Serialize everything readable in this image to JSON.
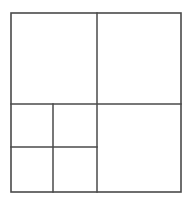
{
  "figure": {
    "type": "rectangle-dissection",
    "background_color": "#ffffff",
    "line_color": "#4a4a4a",
    "cell_fill_color": "#ffffff",
    "canvas": {
      "width": 193,
      "height": 202
    },
    "outer_square": {
      "name": "outer-square",
      "x": 11,
      "y": 13,
      "width": 170,
      "height": 179,
      "stroke_width": 1.6
    },
    "dividers": [
      {
        "name": "vertical-main-divider",
        "orientation": "vertical",
        "x": 97,
        "y1": 13,
        "y2": 192,
        "stroke_width": 1.5
      },
      {
        "name": "horizontal-main-divider",
        "orientation": "horizontal",
        "y": 104,
        "x1": 11,
        "x2": 181,
        "stroke_width": 1.5
      },
      {
        "name": "vertical-sub-divider-lower-left",
        "orientation": "vertical",
        "x": 53,
        "y1": 104,
        "y2": 192,
        "stroke_width": 1.5
      },
      {
        "name": "horizontal-sub-divider-lower-left",
        "orientation": "horizontal",
        "y": 147,
        "x1": 11,
        "x2": 97,
        "stroke_width": 1.5
      }
    ],
    "cells": [
      {
        "name": "cell-top-left",
        "x": 11,
        "y": 13,
        "width": 86,
        "height": 91,
        "label": ""
      },
      {
        "name": "cell-top-right",
        "x": 97,
        "y": 13,
        "width": 84,
        "height": 91,
        "label": ""
      },
      {
        "name": "cell-mid-left",
        "x": 11,
        "y": 104,
        "width": 42,
        "height": 43,
        "label": ""
      },
      {
        "name": "cell-mid-center",
        "x": 53,
        "y": 104,
        "width": 44,
        "height": 43,
        "label": ""
      },
      {
        "name": "cell-bottom-left",
        "x": 11,
        "y": 147,
        "width": 42,
        "height": 45,
        "label": ""
      },
      {
        "name": "cell-bottom-center",
        "x": 53,
        "y": 147,
        "width": 44,
        "height": 45,
        "label": ""
      },
      {
        "name": "cell-bottom-right-large",
        "x": 97,
        "y": 104,
        "width": 84,
        "height": 88,
        "label": ""
      }
    ]
  }
}
